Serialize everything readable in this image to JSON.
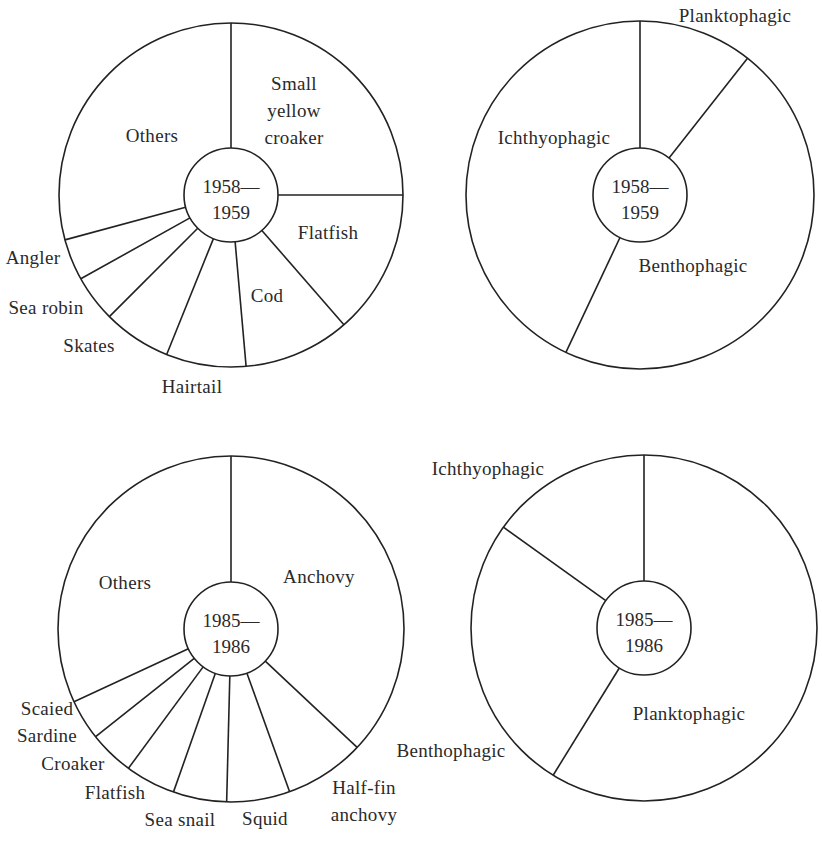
{
  "style": {
    "stroke_color": "#222222",
    "background": "#ffffff",
    "stroke_width": 1.6
  },
  "chart_data": [
    {
      "id": "species-1958",
      "type": "pie",
      "variant": "donut",
      "title": "1958—1959",
      "center_label": [
        "1958—",
        "1959"
      ],
      "start_angle_deg": 0,
      "direction": "clockwise",
      "categories": [
        "Small yellow croaker",
        "Flatfish",
        "Cod",
        "Hairtail",
        "Skates",
        "Sea robin",
        "Angler",
        "Others"
      ],
      "values": [
        25.0,
        13.6,
        10.0,
        7.5,
        6.4,
        4.4,
        3.9,
        29.2
      ],
      "unit": "% of catch (estimated from slice angles)",
      "geometry": {
        "cx": 231,
        "cy": 195,
        "r": 172,
        "r_inner": 47
      },
      "labels": [
        {
          "text": [
            "Small",
            "yellow",
            "croaker"
          ],
          "x": 294,
          "y": 83,
          "line_gap": 27
        },
        {
          "text": [
            "Flatfish"
          ],
          "x": 328,
          "y": 232
        },
        {
          "text": [
            "Cod"
          ],
          "x": 267,
          "y": 295
        },
        {
          "text": [
            "Hairtail"
          ],
          "x": 192,
          "y": 386
        },
        {
          "text": [
            "Skates"
          ],
          "x": 89,
          "y": 345
        },
        {
          "text": [
            "Sea robin"
          ],
          "x": 46,
          "y": 307
        },
        {
          "text": [
            "Angler"
          ],
          "x": 33,
          "y": 257
        },
        {
          "text": [
            "Others"
          ],
          "x": 152,
          "y": 135
        }
      ]
    },
    {
      "id": "feeding-1958",
      "type": "pie",
      "variant": "donut",
      "title": "1958—1959",
      "center_label": [
        "1958—",
        "1959"
      ],
      "start_angle_deg": 0,
      "direction": "clockwise",
      "categories": [
        "Planktophagic",
        "Benthophagic",
        "Ichthyophagic"
      ],
      "values": [
        10.6,
        46.4,
        43.0
      ],
      "unit": "% of catch (estimated from slice angles)",
      "geometry": {
        "cx": 640,
        "cy": 195,
        "r": 174,
        "r_inner": 47
      },
      "labels": [
        {
          "text": [
            "Planktophagic"
          ],
          "x": 735,
          "y": 15
        },
        {
          "text": [
            "Benthophagic"
          ],
          "x": 693,
          "y": 265
        },
        {
          "text": [
            "Ichthyophagic"
          ],
          "x": 554,
          "y": 137
        }
      ]
    },
    {
      "id": "species-1985",
      "type": "pie",
      "variant": "donut",
      "title": "1985—1986",
      "center_label": [
        "1985—",
        "1986"
      ],
      "start_angle_deg": 0,
      "direction": "clockwise",
      "categories": [
        "Anchovy",
        "Half-fin anchovy",
        "Squid",
        "Sea snail",
        "Flatfish",
        "Croaker",
        "Scaied Sardine",
        "Others"
      ],
      "values": [
        37.0,
        7.5,
        5.9,
        5.0,
        4.7,
        4.2,
        3.8,
        31.9
      ],
      "unit": "% of catch (estimated from slice angles)",
      "geometry": {
        "cx": 231,
        "cy": 629,
        "r": 173,
        "r_inner": 47
      },
      "labels": [
        {
          "text": [
            "Anchovy"
          ],
          "x": 319,
          "y": 576
        },
        {
          "text": [
            "Half-fin",
            "anchovy"
          ],
          "x": 364,
          "y": 787,
          "line_gap": 27
        },
        {
          "text": [
            "Squid"
          ],
          "x": 265,
          "y": 818
        },
        {
          "text": [
            "Sea snail"
          ],
          "x": 180,
          "y": 819
        },
        {
          "text": [
            "Flatfish"
          ],
          "x": 115,
          "y": 792
        },
        {
          "text": [
            "Croaker"
          ],
          "x": 73,
          "y": 763
        },
        {
          "text": [
            "Scaied",
            "Sardine"
          ],
          "x": 47,
          "y": 708,
          "line_gap": 27
        },
        {
          "text": [
            "Others"
          ],
          "x": 125,
          "y": 582
        }
      ]
    },
    {
      "id": "feeding-1985",
      "type": "pie",
      "variant": "donut",
      "title": "1985—1986",
      "center_label": [
        "1985—",
        "1986"
      ],
      "start_angle_deg": 0,
      "direction": "clockwise",
      "categories": [
        "Planktophagic",
        "Benthophagic",
        "Ichthyophagic"
      ],
      "values": [
        58.8,
        26.1,
        15.1
      ],
      "unit": "% of catch (estimated from slice angles)",
      "geometry": {
        "cx": 644,
        "cy": 628,
        "r": 173,
        "r_inner": 47
      },
      "labels": [
        {
          "text": [
            "Planktophagic"
          ],
          "x": 689,
          "y": 713
        },
        {
          "text": [
            "Benthophagic"
          ],
          "x": 451,
          "y": 750
        },
        {
          "text": [
            "Ichthyophagic"
          ],
          "x": 488,
          "y": 468
        }
      ]
    }
  ]
}
